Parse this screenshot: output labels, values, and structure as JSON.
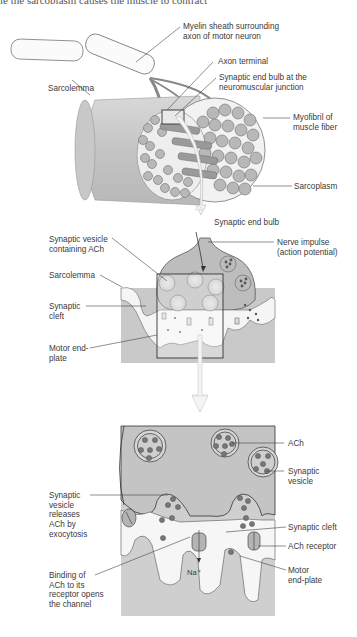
{
  "header": {
    "cut_off_caption": "le the sarcoplasm causes the muscle to contract"
  },
  "top_panel": {
    "labels": {
      "myelin": [
        "Myelin sheath surrounding",
        "axon of motor neuron"
      ],
      "axon_terminal": "Axon terminal",
      "end_bulb_nmj": [
        "Synaptic end bulb at the",
        "neuromuscular junction"
      ],
      "sarcolemma": "Sarcolemma",
      "myofibril": [
        "Myofibril of",
        "muscle fiber"
      ],
      "sarcoplasm": "Sarcoplasm"
    }
  },
  "middle_panel": {
    "labels": {
      "synaptic_end_bulb": "Synaptic end bulb",
      "vesicle_ach": [
        "Synaptic vesicle",
        "containing ACh"
      ],
      "nerve_impulse": [
        "Nerve impulse",
        "(action potential)"
      ],
      "sarcolemma": "Sarcolemma",
      "synaptic_cleft": [
        "Synaptic",
        "cleft"
      ],
      "motor_end_plate": [
        "Motor end-",
        "plate"
      ]
    }
  },
  "bottom_panel": {
    "labels": {
      "ach": "ACh",
      "synaptic_vesicle": [
        "Synaptic",
        "vesicle"
      ],
      "exocytosis": [
        "Synaptic",
        "vesicle",
        "releases",
        "ACh by",
        "exocytosis"
      ],
      "synaptic_cleft": "Synaptic cleft",
      "ach_receptor": "ACh receptor",
      "binding": [
        "Binding of",
        "ACh to its",
        "receptor opens",
        "the channel"
      ],
      "motor_end_plate": [
        "Motor",
        "end-plate"
      ],
      "ion": "Na⁺"
    }
  },
  "colors": {
    "tissue_gray": "#c9c9c9",
    "dark_gray": "#8a8a8a",
    "line": "#444444",
    "arrow_fill": "#f4f4f4"
  }
}
